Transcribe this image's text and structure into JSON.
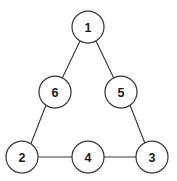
{
  "figure": {
    "type": "undirected-graph-diagram",
    "background_color": "#ffffff",
    "width": 177,
    "height": 181
  },
  "style": {
    "node_fill": "#ffffff",
    "node_stroke": "#3a3a3a",
    "node_stroke_width": 1.25,
    "node_radius": 16,
    "edge_stroke": "#3a3a3a",
    "edge_stroke_width": 1.15,
    "label_color": "#1a1a1a",
    "label_font_size": 12.5
  },
  "graph": {
    "nodes": [
      {
        "id": "n1",
        "label": "1",
        "cx": 88,
        "cy": 27,
        "r": 16
      },
      {
        "id": "n2",
        "label": "2",
        "cx": 22,
        "cy": 157,
        "r": 16
      },
      {
        "id": "n3",
        "label": "3",
        "cx": 152,
        "cy": 157,
        "r": 16
      },
      {
        "id": "n4",
        "label": "4",
        "cx": 88,
        "cy": 157,
        "r": 16
      },
      {
        "id": "n5",
        "label": "5",
        "cx": 121,
        "cy": 92,
        "r": 16
      },
      {
        "id": "n6",
        "label": "6",
        "cx": 55,
        "cy": 92,
        "r": 16
      }
    ],
    "edges": [
      {
        "id": "e1",
        "from": "n1",
        "to": "n6",
        "x1": 80.0,
        "y1": 41.0,
        "x2": 62.5,
        "y2": 77.5
      },
      {
        "id": "e2",
        "from": "n1",
        "to": "n5",
        "x2": 113.5,
        "y2": 77.5,
        "x1": 96.0,
        "y1": 41.0
      },
      {
        "id": "e3",
        "from": "n6",
        "to": "n2",
        "x1": 46.0,
        "y1": 105.0,
        "x2": 31.0,
        "y2": 143.5
      },
      {
        "id": "e4",
        "from": "n5",
        "to": "n3",
        "x1": 130.0,
        "y1": 105.0,
        "x2": 145.0,
        "y2": 143.5
      },
      {
        "id": "e5",
        "from": "n2",
        "to": "n4",
        "x1": 38.0,
        "y1": 157.0,
        "x2": 72.0,
        "y2": 157.0
      },
      {
        "id": "e6",
        "from": "n4",
        "to": "n3",
        "x1": 104.0,
        "y1": 157.0,
        "x2": 136.0,
        "y2": 157.0
      }
    ]
  }
}
